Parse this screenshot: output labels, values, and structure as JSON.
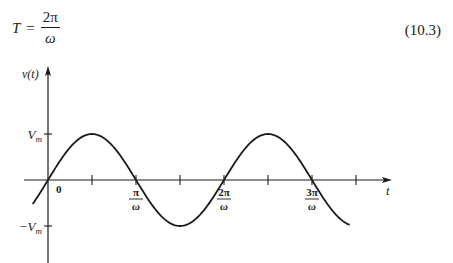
{
  "equation": {
    "lhs": "T",
    "equals": "=",
    "numerator": "2π",
    "denominator": "ω",
    "number": "(10.3)"
  },
  "chart_data": {
    "type": "line",
    "title": "",
    "xlabel": "t",
    "ylabel": "v(t)",
    "function": "v(t) = Vm sin(ωt)",
    "x_units": "π/ω",
    "x_range": [
      -0.17,
      3.5
    ],
    "y_range": [
      -1,
      1
    ],
    "x_ticks": [
      {
        "value": 0,
        "label": "0"
      },
      {
        "value": 0.5,
        "label": ""
      },
      {
        "value": 1,
        "label_num": "π",
        "label_den": "ω"
      },
      {
        "value": 1.5,
        "label": ""
      },
      {
        "value": 2,
        "label_num": "2π",
        "label_den": "ω"
      },
      {
        "value": 2.5,
        "label": ""
      },
      {
        "value": 3,
        "label_num": "3π",
        "label_den": "ω"
      },
      {
        "value": 3.5,
        "label": ""
      }
    ],
    "y_ticks": [
      {
        "value": 1,
        "label": "Vm",
        "label_main": "V",
        "label_sub": "m",
        "sign": ""
      },
      {
        "value": -1,
        "label": "-Vm",
        "label_main": "V",
        "label_sub": "m",
        "sign": "−"
      }
    ],
    "series": [
      {
        "name": "v(t)",
        "amplitude": 1,
        "omega_t_start": -0.17,
        "omega_t_end": 3.42
      }
    ],
    "grid": false,
    "legend": "none"
  }
}
